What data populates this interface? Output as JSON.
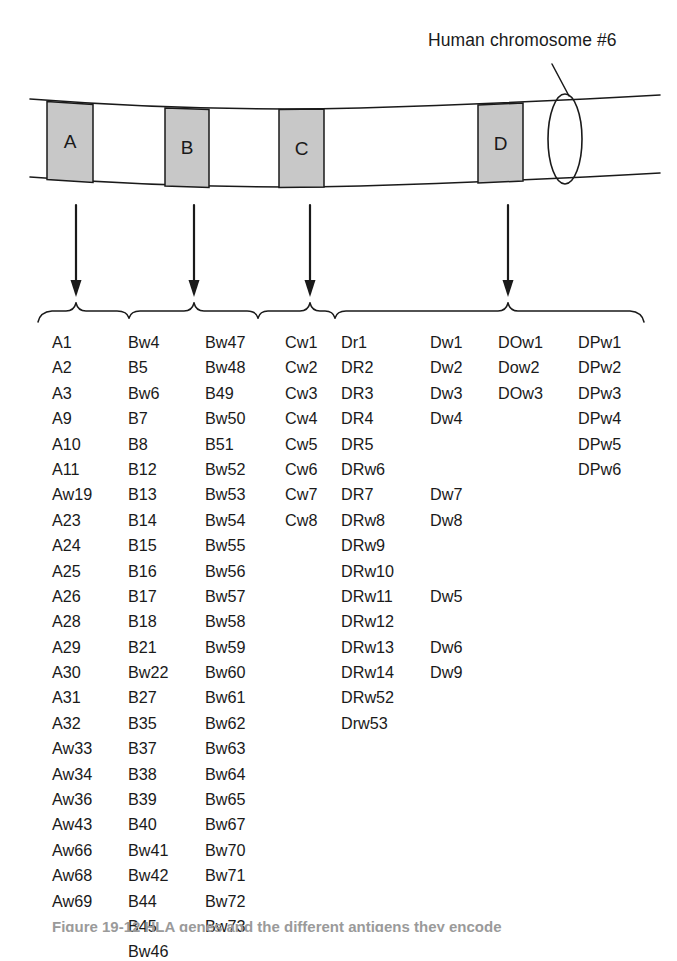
{
  "figure": {
    "chromosome_label": "Human chromosome #6",
    "caption_partial": "Figure 19-12   HLA genes and the different antigens they encode",
    "bands": [
      {
        "letter": "A",
        "x": 47,
        "width": 46
      },
      {
        "letter": "B",
        "x": 165,
        "width": 44
      },
      {
        "letter": "C",
        "x": 279,
        "width": 45
      },
      {
        "letter": "D",
        "x": 478,
        "width": 45
      }
    ],
    "arrows": [
      {
        "from_band": "A",
        "x": 76
      },
      {
        "from_band": "B",
        "x": 194
      },
      {
        "from_band": "C",
        "x": 310
      },
      {
        "from_band": "D",
        "x": 508
      }
    ],
    "colors": {
      "band_fill": "#c8c8c8",
      "stroke": "#1a1a1a",
      "text": "#1a1a1a",
      "background": "#ffffff"
    }
  },
  "allele_columns": [
    {
      "name": "A-locus",
      "left": 52,
      "items": [
        "A1",
        "A2",
        "A3",
        "A9",
        "A10",
        "A11",
        "Aw19",
        "A23",
        "A24",
        "A25",
        "A26",
        "A28",
        "A29",
        "A30",
        "A31",
        "A32",
        "Aw33",
        "Aw34",
        "Aw36",
        "Aw43",
        "Aw66",
        "Aw68",
        "Aw69"
      ]
    },
    {
      "name": "B-locus-part1",
      "left": 128,
      "items": [
        "Bw4",
        "B5",
        "Bw6",
        "B7",
        "B8",
        "B12",
        "B13",
        "B14",
        "B15",
        "B16",
        "B17",
        "B18",
        "B21",
        "Bw22",
        "B27",
        "B35",
        "B37",
        "B38",
        "B39",
        "B40",
        "Bw41",
        "Bw42",
        "B44",
        "B45",
        "Bw46"
      ]
    },
    {
      "name": "B-locus-part2",
      "left": 205,
      "items": [
        "Bw47",
        "Bw48",
        "B49",
        "Bw50",
        "B51",
        "Bw52",
        "Bw53",
        "Bw54",
        "Bw55",
        "Bw56",
        "Bw57",
        "Bw58",
        "Bw59",
        "Bw60",
        "Bw61",
        "Bw62",
        "Bw63",
        "Bw64",
        "Bw65",
        "Bw67",
        "Bw70",
        "Bw71",
        "Bw72",
        "Bw73"
      ]
    },
    {
      "name": "C-locus",
      "left": 285,
      "items": [
        "Cw1",
        "Cw2",
        "Cw3",
        "Cw4",
        "Cw5",
        "Cw6",
        "Cw7",
        "Cw8"
      ]
    },
    {
      "name": "DR-locus",
      "left": 341,
      "items": [
        "Dr1",
        "DR2",
        "DR3",
        "DR4",
        "DR5",
        "DRw6",
        "DR7",
        "DRw8",
        "DRw9",
        "DRw10",
        "DRw11",
        "DRw12",
        "DRw13",
        "DRw14",
        "DRw52",
        "Drw53"
      ]
    },
    {
      "name": "Dw-locus",
      "left": 430,
      "items": [
        "Dw1",
        "Dw2",
        "Dw3",
        "Dw4",
        "",
        "",
        "Dw7",
        "Dw8",
        "",
        "",
        "Dw5",
        "",
        "Dw6",
        "Dw9"
      ]
    },
    {
      "name": "DOw-locus",
      "left": 498,
      "items": [
        "DOw1",
        "Dow2",
        "DOw3"
      ]
    },
    {
      "name": "DPw-locus",
      "left": 578,
      "items": [
        "DPw1",
        "DPw2",
        "DPw3",
        "DPw4",
        "DPw5",
        "DPw6"
      ]
    }
  ]
}
